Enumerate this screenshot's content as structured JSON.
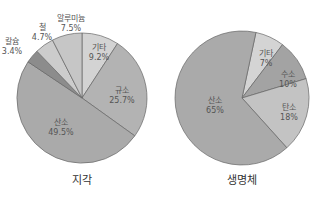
{
  "chart_data": [
    {
      "type": "pie",
      "title": "지각",
      "center": [
        82,
        98
      ],
      "radius": 65,
      "start_angle_deg": 0,
      "slices": [
        {
          "label": "기타",
          "value": 9.2,
          "display": "9.2%",
          "color": "#d3d3d3",
          "label_pos": [
            99,
            50
          ]
        },
        {
          "label": "규소",
          "value": 25.7,
          "display": "25.7%",
          "color": "#b3b3b3",
          "label_pos": [
            122,
            93
          ]
        },
        {
          "label": "산소",
          "value": 49.5,
          "display": "49.5%",
          "color": "#aaaaaa",
          "label_pos": [
            61,
            125
          ]
        },
        {
          "label": "칼슘",
          "value": 3.4,
          "display": "3.4%",
          "color": "#8c8c8c",
          "label_pos": [
            12,
            44
          ],
          "outside": true
        },
        {
          "label": "철",
          "value": 4.7,
          "display": "4.7%",
          "color": "#cccccc",
          "label_pos": [
            42,
            30
          ],
          "outside": true
        },
        {
          "label": "알루미늄",
          "value": 7.5,
          "display": "7.5%",
          "color": "#c6c6c6",
          "label_pos": [
            71,
            21
          ],
          "outside": true
        }
      ]
    },
    {
      "type": "pie",
      "title": "생명체",
      "center": [
        242,
        98
      ],
      "radius": 67,
      "start_angle_deg": 12,
      "slices": [
        {
          "label": "기타",
          "value": 7,
          "display": "7%",
          "color": "#d4d4d4",
          "label_pos": [
            266,
            56
          ]
        },
        {
          "label": "수소",
          "value": 10,
          "display": "10%",
          "color": "#a3a3a3",
          "label_pos": [
            288,
            77
          ]
        },
        {
          "label": "탄소",
          "value": 18,
          "display": "18%",
          "color": "#c3c3c3",
          "label_pos": [
            289,
            110
          ]
        },
        {
          "label": "산소",
          "value": 65,
          "display": "65%",
          "color": "#aaaaaa",
          "label_pos": [
            215,
            103
          ]
        }
      ]
    }
  ],
  "titles": {
    "left": {
      "text": "지각",
      "pos": [
        82,
        184
      ]
    },
    "right": {
      "text": "생명체",
      "pos": [
        242,
        184
      ]
    }
  },
  "stroke_color": "#666666"
}
